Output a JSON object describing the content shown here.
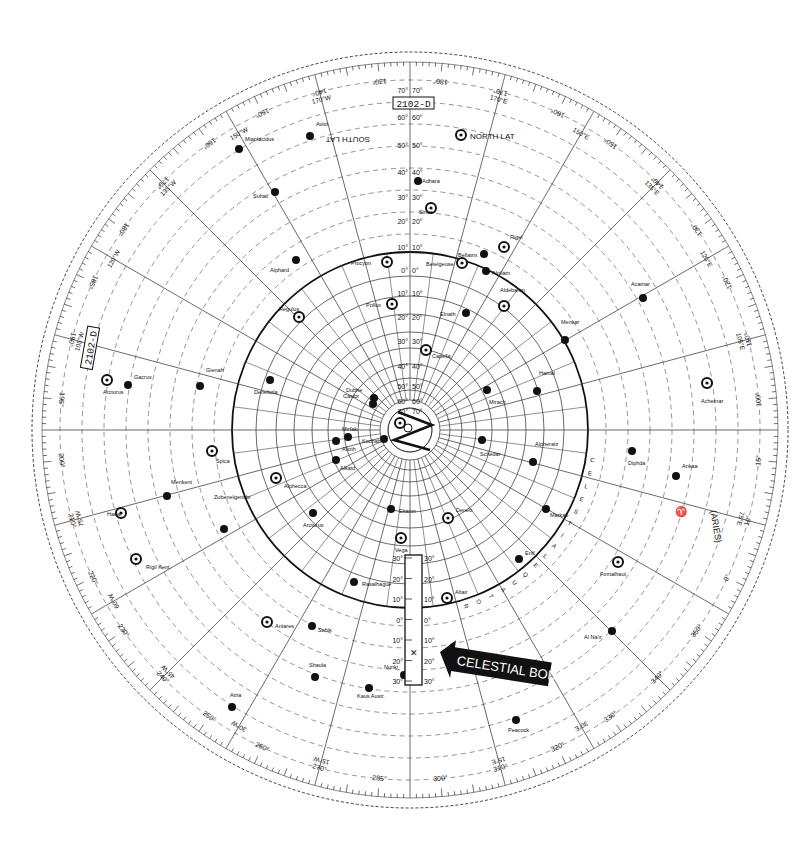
{
  "title": "2102-D",
  "center": {
    "x": 410,
    "y": 430
  },
  "colors": {
    "ink": "#111111",
    "paper": "#ffffff",
    "grid": "#444444",
    "dashed": "#777777",
    "banner_bg": "#111111",
    "banner_text": "#ffffff"
  },
  "labels": {
    "title_top": "2102-D",
    "title_left": "2102-D",
    "north_lat": "NORTH LAT",
    "south_lat": "SOUTH LAT",
    "celestial_equator": "CELESTIAL EQUATOR",
    "aries": "(ARIES)",
    "aries_symbol": "♈",
    "celestial_body": "CELESTIAL BODY"
  },
  "declination_scale": [
    "70°",
    "60°",
    "50°",
    "40°",
    "30°",
    "20°",
    "10°",
    "0°",
    "10°",
    "20°",
    "30°",
    "40°",
    "50°",
    "60°",
    "70°",
    "80°"
  ],
  "slider_scale": [
    "30°",
    "20°",
    "10°",
    "0°",
    "10°",
    "20°",
    "30°"
  ],
  "outer_degree_labels": [
    {
      "angle": 0,
      "label": "180°"
    },
    {
      "angle": 10,
      "label": "170°"
    },
    {
      "angle": 20,
      "label": "160°"
    },
    {
      "angle": 30,
      "label": "150°"
    },
    {
      "angle": 40,
      "label": "140°"
    },
    {
      "angle": 50,
      "label": "130°"
    },
    {
      "angle": 60,
      "label": "120°"
    },
    {
      "angle": 70,
      "label": "110°"
    },
    {
      "angle": 80,
      "label": "100°"
    },
    {
      "angle": 90,
      "label": "15°"
    },
    {
      "angle": 100,
      "label": "10°"
    },
    {
      "angle": 110,
      "label": "0°"
    },
    {
      "angle": 120,
      "label": "350°"
    },
    {
      "angle": 130,
      "label": "340°"
    },
    {
      "angle": 140,
      "label": "330°"
    },
    {
      "angle": 150,
      "label": "320°"
    },
    {
      "angle": 160,
      "label": "310°"
    },
    {
      "angle": 170,
      "label": "300°"
    },
    {
      "angle": 180,
      "label": "285°"
    },
    {
      "angle": 190,
      "label": "270°"
    },
    {
      "angle": 200,
      "label": "260°"
    },
    {
      "angle": 210,
      "label": "250°"
    },
    {
      "angle": 220,
      "label": "240°"
    },
    {
      "angle": 230,
      "label": "230°"
    },
    {
      "angle": 240,
      "label": "220°"
    },
    {
      "angle": 250,
      "label": "210°"
    },
    {
      "angle": 260,
      "label": "200°"
    },
    {
      "angle": 270,
      "label": "195°"
    },
    {
      "angle": 280,
      "label": "190°"
    },
    {
      "angle": 290,
      "label": "185°"
    },
    {
      "angle": 300,
      "label": "180°"
    },
    {
      "angle": 310,
      "label": "170°"
    },
    {
      "angle": 320,
      "label": "160°"
    },
    {
      "angle": 330,
      "label": "150°"
    },
    {
      "angle": 340,
      "label": "140°"
    },
    {
      "angle": 350,
      "label": "130°"
    }
  ],
  "meridian_labels": [
    {
      "angle": 15,
      "label": "170°E"
    },
    {
      "angle": 30,
      "label": "150°E"
    },
    {
      "angle": 45,
      "label": "135°E"
    },
    {
      "angle": 60,
      "label": "120°E"
    },
    {
      "angle": 75,
      "label": "105°E"
    },
    {
      "angle": 105,
      "label": "75°E"
    },
    {
      "angle": 150,
      "label": "30°E"
    },
    {
      "angle": 165,
      "label": "15°E"
    },
    {
      "angle": 195,
      "label": "15°W"
    },
    {
      "angle": 210,
      "label": "30°W"
    },
    {
      "angle": 225,
      "label": "45°W"
    },
    {
      "angle": 240,
      "label": "60°W"
    },
    {
      "angle": 255,
      "label": "75°W"
    },
    {
      "angle": 285,
      "label": "105°W"
    },
    {
      "angle": 300,
      "label": "120°W"
    },
    {
      "angle": 315,
      "label": "135°W"
    },
    {
      "angle": 330,
      "label": "150°W"
    },
    {
      "angle": 345,
      "label": "170°W"
    }
  ],
  "stars": [
    {
      "name": "Polaris",
      "x": 400,
      "y": 423,
      "type": "ring",
      "lx": 0,
      "ly": 0
    },
    {
      "name": "Kochab",
      "x": 384,
      "y": 439,
      "type": "dot",
      "lx": -22,
      "ly": 4
    },
    {
      "name": "Dubhe",
      "x": 374,
      "y": 398,
      "type": "dot",
      "lx": -28,
      "ly": -6
    },
    {
      "name": "Alioth",
      "x": 348,
      "y": 437,
      "type": "dot",
      "lx": -6,
      "ly": 14
    },
    {
      "name": "Mirfak",
      "x": 336,
      "y": 441,
      "type": "dot",
      "lx": 6,
      "ly": -10
    },
    {
      "name": "Alkaid",
      "x": 336,
      "y": 460,
      "type": "dot",
      "lx": 4,
      "ly": 10
    },
    {
      "name": "Capella",
      "x": 426,
      "y": 350,
      "type": "ring",
      "lx": 6,
      "ly": 8
    },
    {
      "name": "Pollux",
      "x": 392,
      "y": 304,
      "type": "ring",
      "lx": -26,
      "ly": 0
    },
    {
      "name": "Procyon",
      "x": 387,
      "y": 262,
      "type": "ring",
      "lx": -36,
      "ly": 0
    },
    {
      "name": "Castor",
      "x": 373,
      "y": 404,
      "type": "dot",
      "lx": -30,
      "ly": -6
    },
    {
      "name": "Regulus",
      "x": 299,
      "y": 317,
      "type": "ring",
      "lx": -20,
      "ly": -6
    },
    {
      "name": "Alphard",
      "x": 296,
      "y": 260,
      "type": "dot",
      "lx": -26,
      "ly": 12
    },
    {
      "name": "Denebola",
      "x": 270,
      "y": 380,
      "type": "dot",
      "lx": -16,
      "ly": 14
    },
    {
      "name": "Gienah",
      "x": 200,
      "y": 386,
      "type": "dot",
      "lx": 0,
      "ly": -14
    },
    {
      "name": "Arcturus",
      "x": 107,
      "y": 380,
      "type": "ring",
      "lx": -4,
      "ly": 14
    },
    {
      "name": "Gacrux",
      "x": 128,
      "y": 385,
      "type": "dot",
      "lx": 6,
      "ly": -6
    },
    {
      "name": "Spica",
      "x": 212,
      "y": 451,
      "type": "ring",
      "lx": 4,
      "ly": 12
    },
    {
      "name": "Menkent",
      "x": 167,
      "y": 496,
      "type": "dot",
      "lx": 4,
      "ly": -12
    },
    {
      "name": "Zubenelgenubi",
      "x": 224,
      "y": 529,
      "type": "dot",
      "lx": -10,
      "ly": -30
    },
    {
      "name": "Hadar",
      "x": 121,
      "y": 513,
      "type": "ring",
      "lx": -14,
      "ly": 0
    },
    {
      "name": "Rigil Kent.",
      "x": 136,
      "y": 559,
      "type": "ring",
      "lx": 10,
      "ly": 10
    },
    {
      "name": "Alphecca",
      "x": 276,
      "y": 478,
      "type": "ring",
      "lx": 8,
      "ly": 10
    },
    {
      "name": "Arcturus ",
      "x": 313,
      "y": 513,
      "type": "dot",
      "lx": -10,
      "ly": 14
    },
    {
      "name": "Eltanin",
      "x": 391,
      "y": 509,
      "type": "dot",
      "lx": 8,
      "ly": 4
    },
    {
      "name": "Vega",
      "x": 401,
      "y": 538,
      "type": "ring",
      "lx": -6,
      "ly": 14
    },
    {
      "name": "Rasalhague",
      "x": 354,
      "y": 582,
      "type": "dot",
      "lx": 8,
      "ly": 4
    },
    {
      "name": "Deneb",
      "x": 448,
      "y": 518,
      "type": "ring",
      "lx": 8,
      "ly": -6
    },
    {
      "name": "Altair",
      "x": 447,
      "y": 598,
      "type": "ring",
      "lx": 8,
      "ly": -4
    },
    {
      "name": "Antares",
      "x": 267,
      "y": 622,
      "type": "ring",
      "lx": 8,
      "ly": 6
    },
    {
      "name": "Sabik",
      "x": 312,
      "y": 626,
      "type": "dot",
      "lx": 6,
      "ly": 6
    },
    {
      "name": "Shaula",
      "x": 315,
      "y": 677,
      "type": "dot",
      "lx": -6,
      "ly": -10
    },
    {
      "name": "Nunki",
      "x": 404,
      "y": 675,
      "type": "dot",
      "lx": -20,
      "ly": -6
    },
    {
      "name": "Kaus Austr.",
      "x": 369,
      "y": 688,
      "type": "dot",
      "lx": -12,
      "ly": 10
    },
    {
      "name": "Atria",
      "x": 232,
      "y": 707,
      "type": "dot",
      "lx": -2,
      "ly": -10
    },
    {
      "name": "Peacock",
      "x": 516,
      "y": 720,
      "type": "dot",
      "lx": -8,
      "ly": 12
    },
    {
      "name": "Enif",
      "x": 519,
      "y": 559,
      "type": "dot",
      "lx": 6,
      "ly": -4
    },
    {
      "name": "Markab",
      "x": 546,
      "y": 509,
      "type": "dot",
      "lx": 4,
      "ly": 8
    },
    {
      "name": "Alpheratz",
      "x": 533,
      "y": 462,
      "type": "dot",
      "lx": 2,
      "ly": -16
    },
    {
      "name": "Schedar",
      "x": 482,
      "y": 440,
      "type": "dot",
      "lx": -2,
      "ly": 16
    },
    {
      "name": "Mirach",
      "x": 487,
      "y": 390,
      "type": "dot",
      "lx": 2,
      "ly": 14
    },
    {
      "name": "Hamal",
      "x": 537,
      "y": 391,
      "type": "dot",
      "lx": 2,
      "ly": -16
    },
    {
      "name": "Diphda",
      "x": 632,
      "y": 451,
      "type": "dot",
      "lx": -4,
      "ly": 14
    },
    {
      "name": "Ankaa",
      "x": 676,
      "y": 476,
      "type": "dot",
      "lx": 6,
      "ly": -8
    },
    {
      "name": "Achernar",
      "x": 707,
      "y": 383,
      "type": "ring",
      "lx": -6,
      "ly": 20
    },
    {
      "name": "Fomalhaut",
      "x": 618,
      "y": 562,
      "type": "ring",
      "lx": -18,
      "ly": 14
    },
    {
      "name": "Al Na'ir",
      "x": 612,
      "y": 631,
      "type": "dot",
      "lx": -28,
      "ly": 8
    },
    {
      "name": "Menkar",
      "x": 565,
      "y": 340,
      "type": "dot",
      "lx": -4,
      "ly": -16
    },
    {
      "name": "Acamar",
      "x": 643,
      "y": 298,
      "type": "dot",
      "lx": -12,
      "ly": -12
    },
    {
      "name": "Rigel",
      "x": 504,
      "y": 247,
      "type": "ring",
      "lx": 6,
      "ly": -8
    },
    {
      "name": "Bellatrix",
      "x": 484,
      "y": 254,
      "type": "dot",
      "lx": -26,
      "ly": 0
    },
    {
      "name": "Betelgeuse",
      "x": 462,
      "y": 263,
      "type": "ring",
      "lx": -36,
      "ly": 0
    },
    {
      "name": "Elnath",
      "x": 466,
      "y": 313,
      "type": "dot",
      "lx": -26,
      "ly": 0
    },
    {
      "name": "Aldebaran",
      "x": 504,
      "y": 306,
      "type": "ring",
      "lx": -4,
      "ly": -14
    },
    {
      "name": "Alnilam",
      "x": 486,
      "y": 271,
      "type": "dot",
      "lx": 6,
      "ly": 4
    },
    {
      "name": "Sirius",
      "x": 431,
      "y": 208,
      "type": "ring",
      "lx": -12,
      "ly": 6
    },
    {
      "name": "Adhara",
      "x": 418,
      "y": 181,
      "type": "dot",
      "lx": 4,
      "ly": 2
    },
    {
      "name": "Suhail",
      "x": 275,
      "y": 192,
      "type": "dot",
      "lx": -22,
      "ly": 6
    },
    {
      "name": "Avior",
      "x": 310,
      "y": 136,
      "type": "dot",
      "lx": 0,
      "ly": -10
    },
    {
      "name": "Canopus",
      "x": 461,
      "y": 135,
      "type": "ring",
      "lx": 0,
      "ly": 0
    },
    {
      "name": "Miaplacidus",
      "x": 239,
      "y": 149,
      "type": "dot",
      "lx": 6,
      "ly": -8
    }
  ]
}
